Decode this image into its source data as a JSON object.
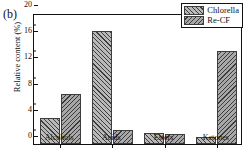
{
  "panel": {
    "label": "(b)"
  },
  "chart_data": {
    "type": "bar",
    "title": "",
    "xlabel": "",
    "ylabel": "Relative content (%)",
    "categories": [
      "Alcohols",
      "Acids",
      "Esters",
      "Ketones"
    ],
    "series": [
      {
        "name": "Chlorella",
        "values": [
          3.9,
          17.2,
          1.7,
          1.1
        ],
        "hatch": "///",
        "color": "#b9b9b9"
      },
      {
        "name": "Re-CF",
        "values": [
          7.7,
          2.1,
          1.6,
          14.2
        ],
        "hatch": "\\\\\\",
        "color": "#a8a8a8"
      }
    ],
    "ylim": [
      0,
      20
    ],
    "yticks": [
      0,
      4,
      8,
      12,
      16,
      20
    ],
    "ytick_labels": [
      "0",
      "4",
      "8",
      "12",
      "16",
      "20"
    ],
    "minor_ytick_interval": 2,
    "grid": false,
    "legend_position": "top-right"
  },
  "legend": {
    "entries": [
      {
        "label": "Chlorella"
      },
      {
        "label": "Re-CF"
      }
    ]
  }
}
